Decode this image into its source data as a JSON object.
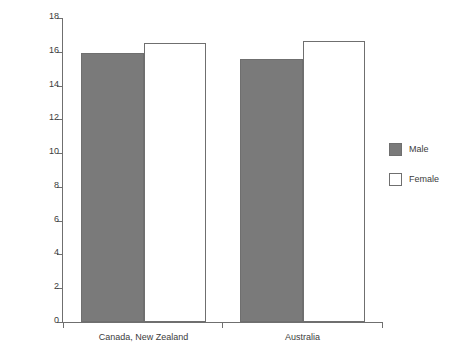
{
  "chart_data": {
    "type": "bar",
    "title": "",
    "subtitle": "",
    "xlabel": "",
    "ylabel": "Age of first sexual intercourse experience",
    "categories": [
      "Canada, New Zealand",
      "Australia"
    ],
    "series": [
      {
        "name": "Male",
        "values": [
          15.95,
          15.55
        ],
        "color": "#7a7a7a"
      },
      {
        "name": "Female",
        "values": [
          16.5,
          16.65
        ],
        "color": "#ffffff"
      }
    ],
    "ylim": [
      0,
      18
    ],
    "ytick_step": 2,
    "yticks": [
      0,
      2,
      4,
      6,
      8,
      10,
      12,
      14,
      16,
      18
    ],
    "ytick_labels": [
      "0",
      "2",
      "4",
      "6",
      "8",
      "10",
      "12",
      "14",
      "16",
      "18"
    ],
    "grid": false,
    "legend_position": "right",
    "legend": [
      "Male",
      "Female"
    ]
  },
  "axis": {
    "y_title": "Age of first sexual intercourse experience"
  },
  "legend": {
    "items": [
      {
        "label": "Male",
        "swatch": "male-swatch"
      },
      {
        "label": "Female",
        "swatch": "female-swatch"
      }
    ]
  }
}
